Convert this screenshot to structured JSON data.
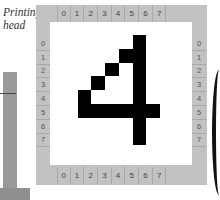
{
  "caption": {
    "line1": "Printing",
    "line2": "head"
  },
  "ruler": {
    "columns": [
      "0",
      "1",
      "2",
      "3",
      "4",
      "5",
      "6",
      "7"
    ],
    "rows": [
      "0",
      "1",
      "2",
      "3",
      "4",
      "5",
      "6",
      "7"
    ]
  },
  "glyph": {
    "character": "4",
    "grid_size": 8,
    "black_cells": [
      [
        0,
        5
      ],
      [
        1,
        4
      ],
      [
        1,
        5
      ],
      [
        2,
        3
      ],
      [
        2,
        5
      ],
      [
        3,
        2
      ],
      [
        3,
        5
      ],
      [
        4,
        1
      ],
      [
        4,
        5
      ],
      [
        5,
        1
      ],
      [
        5,
        2
      ],
      [
        5,
        3
      ],
      [
        5,
        4
      ],
      [
        5,
        5
      ],
      [
        5,
        6
      ],
      [
        6,
        5
      ],
      [
        7,
        5
      ]
    ]
  },
  "colors": {
    "frame": "#c2c2c2",
    "ink": "#000000",
    "paper": "#ffffff",
    "head": "#9a9a9a"
  }
}
